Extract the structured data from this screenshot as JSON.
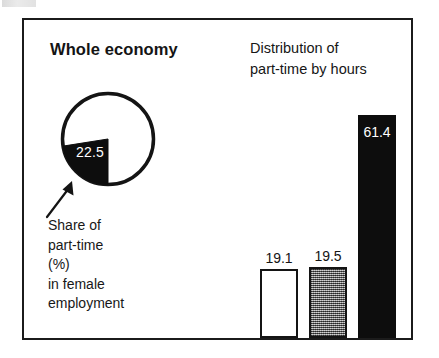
{
  "figure": {
    "pie_panel": {
      "title": "Whole economy",
      "slice_value": "22.5",
      "caption_lines": [
        "Share of",
        "part-time",
        "(%)",
        "in female",
        "employment"
      ],
      "arrow_icon": "callout-arrow-icon"
    },
    "bars_panel": {
      "title_lines": [
        "Distribution of",
        "part-time by hours"
      ]
    },
    "colors": {
      "ink": "#141414",
      "white_bar": "#ffffff",
      "gray_bar": "#8e8e8e",
      "black_bar": "#0d0d0d",
      "frame": "#1b1b1b"
    }
  },
  "chart_data": [
    {
      "type": "pie",
      "title": "Whole economy",
      "labels": [
        "Part-time share",
        "Remainder"
      ],
      "values": [
        22.5,
        77.5
      ],
      "data_labels": [
        "22.5",
        ""
      ],
      "slice_colors": [
        "#0d0d0d",
        "#ffffff"
      ],
      "annotation": "Share of part-time (%) in female employment",
      "units": "percent",
      "legend": "none"
    },
    {
      "type": "bar",
      "title": "Distribution of part-time by hours",
      "categories": [
        "bar-1",
        "bar-2",
        "bar-3"
      ],
      "values": [
        19.1,
        19.5,
        61.4
      ],
      "data_labels": [
        "19.1",
        "19.5",
        "61.4"
      ],
      "bar_colors": [
        "#ffffff",
        "#8e8e8e",
        "#0d0d0d"
      ],
      "ylim": [
        0,
        66
      ],
      "xlabel": "",
      "ylabel": "",
      "grid": false,
      "legend": "none",
      "label_positions": [
        "above",
        "above",
        "inside-top"
      ]
    }
  ]
}
